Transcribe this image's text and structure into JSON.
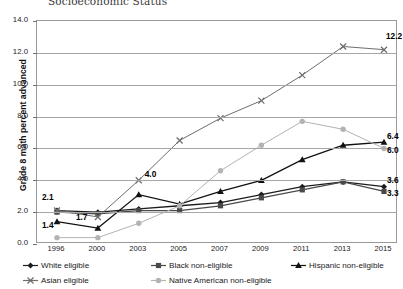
{
  "chart_data": {
    "type": "line",
    "title": "Socioeconomic Status",
    "xlabel": "",
    "ylabel": "Grade 8 math percent advanced",
    "ylim": [
      0.0,
      14.0
    ],
    "ytick_step": 2.0,
    "ytick_labels": [
      "14.0",
      "12.0",
      "10.0",
      "8.0",
      "6.0",
      "4.0",
      "2.0",
      "0.0"
    ],
    "grid": true,
    "legend_position": "bottom",
    "categories": [
      "1996",
      "2000",
      "2003",
      "2005",
      "2007",
      "2009",
      "2011",
      "2013",
      "2015"
    ],
    "x": [
      1996,
      2000,
      2003,
      2005,
      2007,
      2009,
      2011,
      2013,
      2015
    ],
    "series": [
      {
        "name": "White eligible",
        "marker": "diamond",
        "color": "#1c1c1c",
        "values": [
          2.1,
          2.0,
          2.2,
          2.4,
          2.6,
          3.1,
          3.6,
          3.9,
          3.6
        ]
      },
      {
        "name": "Black non-eligible",
        "marker": "square",
        "color": "#4a4a4a",
        "values": [
          2.0,
          1.9,
          2.1,
          2.1,
          2.4,
          2.9,
          3.4,
          3.9,
          3.3
        ]
      },
      {
        "name": "Hispanic non-eligible",
        "marker": "triangle",
        "color": "#111111",
        "values": [
          1.4,
          1.0,
          3.1,
          2.5,
          3.3,
          4.0,
          5.3,
          6.2,
          6.4
        ]
      },
      {
        "name": "Asian eligible",
        "marker": "x",
        "color": "#6e6e6e",
        "values": [
          2.1,
          1.7,
          4.0,
          6.5,
          7.9,
          9.0,
          10.6,
          12.4,
          12.2
        ]
      },
      {
        "name": "Native American non-eligible",
        "marker": "circle",
        "color": "#b3b3b3",
        "values": [
          0.4,
          0.4,
          1.3,
          2.4,
          4.6,
          6.2,
          7.7,
          7.2,
          6.0
        ]
      }
    ],
    "annotations": [
      {
        "text": "2.1",
        "series": "White eligible",
        "x": 1996,
        "y": 2.1,
        "dx": -14,
        "dy": -13
      },
      {
        "text": "1.4",
        "series": "Hispanic non-eligible",
        "x": 1996,
        "y": 1.4,
        "dx": -14,
        "dy": 4
      },
      {
        "text": "1.7",
        "series": "Asian eligible",
        "x": 2000,
        "y": 1.7,
        "dx": -21,
        "dy": 1
      },
      {
        "text": "4.0",
        "series": "Asian eligible",
        "x": 2003,
        "y": 4.0,
        "dx": 7,
        "dy": -5
      },
      {
        "text": "12.2",
        "series": "Asian eligible",
        "x": 2015,
        "y": 12.2,
        "dx": 3,
        "dy": -13
      },
      {
        "text": "6.4",
        "series": "Hispanic non-eligible",
        "x": 2015,
        "y": 6.4,
        "dx": 4,
        "dy": -5
      },
      {
        "text": "6.0",
        "series": "Native American non-eligible",
        "x": 2015,
        "y": 6.0,
        "dx": 4,
        "dy": 3
      },
      {
        "text": "3.6",
        "series": "White eligible",
        "x": 2015,
        "y": 3.6,
        "dx": 4,
        "dy": -6
      },
      {
        "text": "3.3",
        "series": "Black non-eligible",
        "x": 2015,
        "y": 3.3,
        "dx": 4,
        "dy": 3
      }
    ]
  },
  "legend": {
    "items": [
      {
        "label": "White eligible",
        "marker": "diamond",
        "color": "#1c1c1c"
      },
      {
        "label": "Black non-eligible",
        "marker": "square",
        "color": "#4a4a4a"
      },
      {
        "label": "Hispanic non-eligible",
        "marker": "triangle",
        "color": "#111111"
      },
      {
        "label": "Asian eligible",
        "marker": "x",
        "color": "#6e6e6e"
      },
      {
        "label": "Native American non-eligible",
        "marker": "circle",
        "color": "#b3b3b3"
      }
    ]
  }
}
